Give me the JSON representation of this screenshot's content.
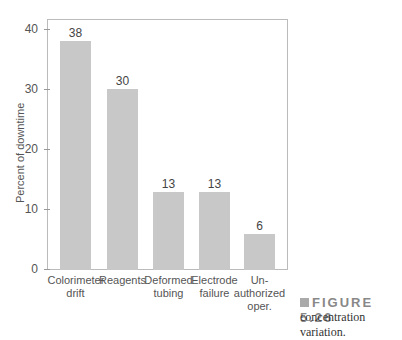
{
  "chart_data": {
    "type": "bar",
    "title": "",
    "xlabel": "",
    "ylabel": "Percent of downtime",
    "ylim": [
      0,
      40
    ],
    "yticks": [
      0,
      10,
      20,
      30,
      40
    ],
    "grid": false,
    "categories": [
      "Colorimeter drift",
      "Reagents",
      "Deformed tubing",
      "Electrode failure",
      "Un-authorized oper."
    ],
    "category_lines": [
      [
        "Colorimeter",
        "drift"
      ],
      [
        "Reagents"
      ],
      [
        "Deformed",
        "tubing"
      ],
      [
        "Electrode",
        "failure"
      ],
      [
        "Un-",
        "authorized",
        "oper."
      ]
    ],
    "values": [
      38,
      30,
      13,
      13,
      6
    ],
    "value_labels": [
      "38",
      "30",
      "13",
      "13",
      "6"
    ],
    "bar_color": "#c8c8c8"
  },
  "figure": {
    "label": "FIGURE 5.26",
    "caption": "concentration variation."
  },
  "axis": {
    "ylabel": "Percent of downtime",
    "ticks": [
      "0",
      "10",
      "20",
      "30",
      "40"
    ]
  }
}
